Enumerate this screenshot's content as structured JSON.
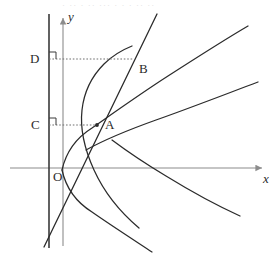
{
  "figure": {
    "kind": "geometry-diagram",
    "background_color": "#ffffff",
    "curve_color": "#2b2b2b",
    "axis_color": "#8c8c8c",
    "directrix_color": "#3a3a3a",
    "dotted_color": "#6f6f6f",
    "label_color": "#2b2b2b",
    "top_residue_text": "· ·· · ·· ··· · · · ·· ··"
  },
  "axes": {
    "x_axis": {
      "label": "x",
      "name": "x-axis",
      "y_pixel": 168,
      "x_start": 10,
      "x_end": 266,
      "arrow": "right"
    },
    "y_axis": {
      "label": "y",
      "name": "y-axis",
      "x_pixel": 63,
      "y_start": 246,
      "y_end": 14,
      "arrow": "up"
    },
    "origin": {
      "label": "O",
      "x_pixel": 63,
      "y_pixel": 168
    }
  },
  "directrix": {
    "name": "directrix-line",
    "x_pixel": 49,
    "y_top": 14,
    "y_bottom": 248
  },
  "points": [
    {
      "id": "A",
      "label": "A",
      "x_pixel": 97,
      "y_pixel": 125,
      "label_dx": 8,
      "label_dy": -1,
      "marker": "dot",
      "description": "intersection of secant line with inner parabola"
    },
    {
      "id": "B",
      "label": "B",
      "x_pixel": 133,
      "y_pixel": 59,
      "label_dx": 7,
      "label_dy": 10,
      "marker": "none",
      "description": "intersection of secant line with outer parabola"
    },
    {
      "id": "C",
      "label": "C",
      "x_pixel": 49,
      "y_pixel": 125,
      "label_dx": -14,
      "label_dy": 0,
      "marker": "right-angle",
      "description": "foot of perpendicular from A to the directrix"
    },
    {
      "id": "D",
      "label": "D",
      "x_pixel": 49,
      "y_pixel": 59,
      "label_dx": -14,
      "label_dy": 0,
      "marker": "right-angle",
      "description": "foot of perpendicular from B to the directrix"
    }
  ],
  "dotted_segments": [
    {
      "name": "segment-CA",
      "from": "C",
      "to": "A",
      "y_pixel": 125,
      "x_from": 49,
      "x_to": 97
    },
    {
      "name": "segment-DB",
      "from": "D",
      "to": "B",
      "y_pixel": 59,
      "x_from": 49,
      "x_to": 133
    }
  ],
  "curves": [
    {
      "name": "inner-parabola",
      "type": "parabola",
      "opens": "right",
      "vertex_pixel": [
        62,
        168
      ],
      "description": "narrow right-opening parabola passing through A and crossing the x-axis"
    },
    {
      "name": "outer-parabola",
      "type": "parabola",
      "opens": "right",
      "vertex_pixel": [
        62,
        168
      ],
      "description": "wide right-opening parabola passing through A and B"
    },
    {
      "name": "secant-line",
      "type": "line",
      "through": [
        "A",
        "B"
      ],
      "p1_pixel": [
        44,
        247
      ],
      "p2_pixel": [
        156,
        14
      ],
      "description": "straight line through A and B extended to both ends"
    }
  ]
}
